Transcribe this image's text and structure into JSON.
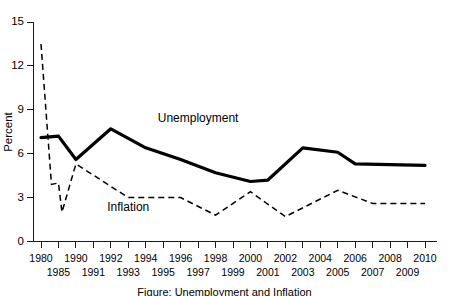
{
  "chart_data": {
    "type": "line",
    "title": "",
    "xlabel": "",
    "ylabel": "Percent",
    "ylim": [
      0,
      15
    ],
    "yticks": [
      0,
      3,
      6,
      9,
      12,
      15
    ],
    "ytick_labels": [
      "0",
      "3",
      "6",
      "9",
      "12",
      "15"
    ],
    "grid": false,
    "legend_position": "inline-annotations",
    "categories": [
      "1980",
      "1985",
      "1990",
      "1991",
      "1992",
      "1993",
      "1994",
      "1995",
      "1996",
      "1997",
      "1998",
      "1999",
      "2000",
      "2001",
      "2002",
      "2003",
      "2004",
      "2005",
      "2006",
      "2007",
      "2008",
      "2009",
      "2010"
    ],
    "xtick_labels_top_row": [
      "1980",
      "",
      "1990",
      "",
      "1992",
      "",
      "1994",
      "",
      "1996",
      "",
      "1998",
      "",
      "2000",
      "",
      "2002",
      "",
      "2004",
      "",
      "2006",
      "",
      "2008",
      "",
      "2010"
    ],
    "xtick_labels_bottom_row": [
      "",
      "1985",
      "",
      "1991",
      "",
      "1993",
      "",
      "1995",
      "",
      "1997",
      "",
      "1999",
      "",
      "2001",
      "",
      "2003",
      "",
      "2005",
      "",
      "2007",
      "",
      "2009",
      ""
    ],
    "series": [
      {
        "name": "Unemployment",
        "style": "solid",
        "annotation": "Unemployment",
        "values": [
          7.1,
          7.2,
          5.6,
          6.8,
          7.5,
          6.9,
          6.1,
          5.6,
          5.4,
          4.9,
          4.5,
          4.2,
          4.0,
          4.7,
          5.8,
          6.0,
          5.5,
          5.1,
          4.6,
          4.6,
          5.8,
          9.3,
          9.6
        ]
      },
      {
        "name": "Inflation",
        "style": "dashed",
        "annotation": "Inflation",
        "values": [
          13.5,
          3.6,
          5.4,
          4.2,
          3.0,
          3.0,
          2.6,
          2.8,
          3.0,
          2.3,
          1.6,
          2.2,
          3.4,
          2.8,
          1.6,
          2.3,
          2.7,
          3.4,
          3.2,
          2.9,
          3.8,
          -0.4,
          1.6
        ]
      }
    ],
    "annotations": [
      {
        "text": "Unemployment",
        "x_category": "1997",
        "y_value": 8.2
      },
      {
        "text": "Inflation",
        "x_category": "1993",
        "y_value": 2.1
      }
    ],
    "rendered_unemployment_points": [
      [
        1980,
        7.1
      ],
      [
        1985,
        7.2
      ],
      [
        1990,
        5.6
      ],
      [
        1992,
        7.7
      ],
      [
        1994,
        6.4
      ],
      [
        1996,
        5.6
      ],
      [
        1998,
        4.7
      ],
      [
        2000,
        4.1
      ],
      [
        2001,
        4.2
      ],
      [
        2003,
        6.4
      ],
      [
        2005,
        6.1
      ],
      [
        2006,
        5.3
      ],
      [
        2010,
        5.2
      ]
    ],
    "rendered_inflation_points": [
      [
        1980,
        13.5
      ],
      [
        1983,
        3.9
      ],
      [
        1985,
        4.0
      ],
      [
        1986,
        2.0
      ],
      [
        1990,
        5.3
      ],
      [
        1993,
        3.0
      ],
      [
        1996,
        3.0
      ],
      [
        1998,
        1.8
      ],
      [
        2000,
        3.4
      ],
      [
        2002,
        1.7
      ],
      [
        2005,
        3.5
      ],
      [
        2007,
        2.6
      ],
      [
        2010,
        2.6
      ]
    ],
    "colors": {
      "axis": "#1a1a1a",
      "unemployment_line": "#000000",
      "inflation_line": "#000000",
      "background": "#ffffff"
    }
  },
  "figure": {
    "y_axis_title": "Percent",
    "caption_fragment": "Figure: Unemployment and Inflation"
  }
}
